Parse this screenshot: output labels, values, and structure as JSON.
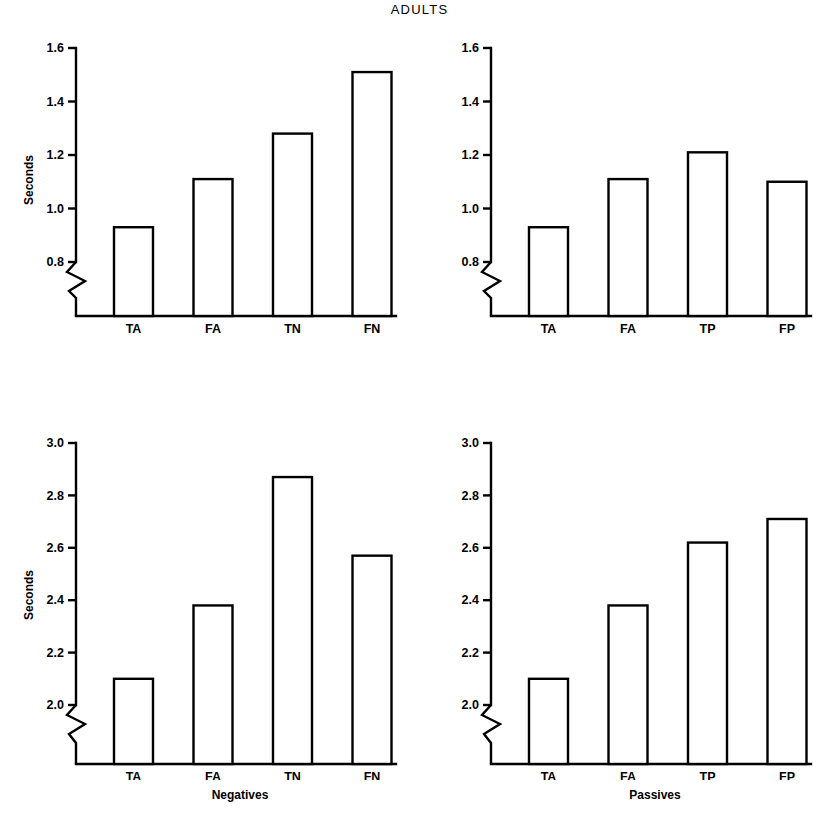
{
  "figure": {
    "title": "ADULTS",
    "background": "#ffffff",
    "ink_color": "#000000",
    "axis_break_marker": "zigzag"
  },
  "chart_data": [
    {
      "id": "top-left",
      "type": "bar",
      "title": "",
      "xlabel": "",
      "ylabel": "Seconds",
      "categories": [
        "TA",
        "FA",
        "TN",
        "FN"
      ],
      "values": [
        0.93,
        1.11,
        1.28,
        1.51
      ],
      "ylim": [
        0.7,
        1.6
      ],
      "yticks": [
        0.8,
        1.0,
        1.2,
        1.4,
        1.6
      ],
      "ytick_labels": [
        "0.8",
        "1.0",
        "1.2",
        "1.4",
        "1.6"
      ],
      "grid": false,
      "legend": "none",
      "axis_broken_below": 0.8,
      "bar_fill": "#ffffff",
      "bar_edge": "#000000"
    },
    {
      "id": "top-right",
      "type": "bar",
      "title": "",
      "xlabel": "",
      "ylabel": "",
      "categories": [
        "TA",
        "FA",
        "TP",
        "FP"
      ],
      "values": [
        0.93,
        1.11,
        1.21,
        1.1
      ],
      "ylim": [
        0.7,
        1.6
      ],
      "yticks": [
        0.8,
        1.0,
        1.2,
        1.4,
        1.6
      ],
      "ytick_labels": [
        "0.8",
        "1.0",
        "1.2",
        "1.4",
        "1.6"
      ],
      "grid": false,
      "legend": "none",
      "axis_broken_below": 0.8,
      "bar_fill": "#ffffff",
      "bar_edge": "#000000"
    },
    {
      "id": "bottom-left",
      "type": "bar",
      "title": "",
      "xlabel": "Negatives",
      "ylabel": "Seconds",
      "categories": [
        "TA",
        "FA",
        "TN",
        "FN"
      ],
      "values": [
        2.1,
        2.38,
        2.87,
        2.57
      ],
      "ylim": [
        1.9,
        3.0
      ],
      "yticks": [
        2.0,
        2.2,
        2.4,
        2.6,
        2.8,
        3.0
      ],
      "ytick_labels": [
        "2.0",
        "2.2",
        "2.4",
        "2.6",
        "2.8",
        "3.0"
      ],
      "grid": false,
      "legend": "none",
      "axis_broken_below": 2.0,
      "bar_fill": "#ffffff",
      "bar_edge": "#000000"
    },
    {
      "id": "bottom-right",
      "type": "bar",
      "title": "",
      "xlabel": "Passives",
      "ylabel": "",
      "categories": [
        "TA",
        "FA",
        "TP",
        "FP"
      ],
      "values": [
        2.1,
        2.38,
        2.62,
        2.71
      ],
      "ylim": [
        1.9,
        3.0
      ],
      "yticks": [
        2.0,
        2.2,
        2.4,
        2.6,
        2.8,
        3.0
      ],
      "ytick_labels": [
        "2.0",
        "2.2",
        "2.4",
        "2.6",
        "2.8",
        "3.0"
      ],
      "grid": false,
      "legend": "none",
      "axis_broken_below": 2.0,
      "bar_fill": "#ffffff",
      "bar_edge": "#000000"
    }
  ],
  "axis_titles": {
    "y_top_left": "Seconds",
    "y_bottom_left": "Seconds",
    "x_bottom_left": "Negatives",
    "x_bottom_right": "Passives"
  }
}
